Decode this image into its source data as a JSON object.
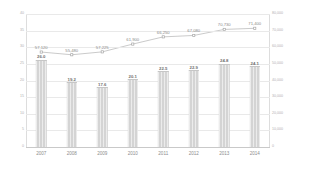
{
  "chart_data": {
    "type": "bar",
    "title": "",
    "subtitle": "",
    "xlabel": "",
    "ylabel": "",
    "y2label": "",
    "grid": true,
    "legend": "none",
    "categories": [
      "2007",
      "2008",
      "2009",
      "2010",
      "2011",
      "2012",
      "2013",
      "2014"
    ],
    "series": [
      {
        "name": "bars",
        "type": "bar",
        "axis": "left",
        "color": "#d4d4d4",
        "values": [
          26.0,
          19.2,
          17.6,
          20.1,
          22.5,
          22.9,
          24.8,
          24.1
        ],
        "labels": [
          "26.0",
          "19.2",
          "17.6",
          "20.1",
          "22.5",
          "22.9",
          "24.8",
          "24.1"
        ]
      },
      {
        "name": "line",
        "type": "line",
        "axis": "right",
        "color": "#bdbdbd",
        "values": [
          57120,
          55480,
          57225,
          61900,
          66250,
          67080,
          70730,
          71400
        ],
        "labels": [
          "57,120",
          "55,480",
          "57,225",
          "61,900",
          "66,250",
          "67,080",
          "70,730",
          "71,400"
        ]
      }
    ],
    "ylim": [
      0,
      40
    ],
    "y2lim": [
      0,
      80000
    ],
    "yticks": [
      0,
      5,
      10,
      15,
      20,
      25,
      30,
      35,
      40
    ],
    "ytick_labels": [
      "0",
      "5",
      "10",
      "15",
      "20",
      "25",
      "30",
      "35",
      "40"
    ],
    "y2ticks": [
      0,
      10000,
      20000,
      30000,
      40000,
      50000,
      60000,
      70000,
      80000
    ],
    "y2tick_labels": [
      "0",
      "10,000",
      "20,000",
      "30,000",
      "40,000",
      "50,000",
      "60,000",
      "70,000",
      "80,000"
    ]
  }
}
